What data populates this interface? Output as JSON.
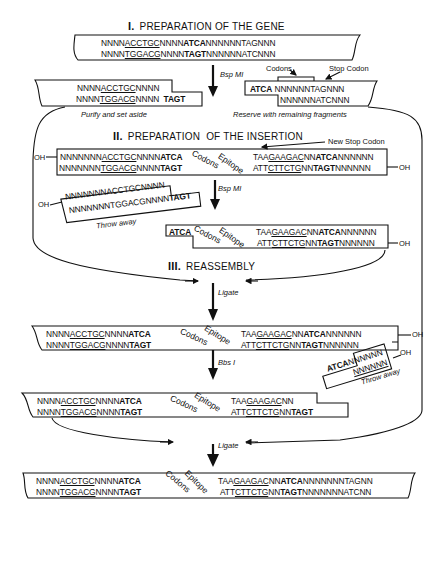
{
  "sections": {
    "s1": {
      "numeral": "I.",
      "title": "PREPARATION OF THE GENE"
    },
    "s2": {
      "numeral": "II.",
      "title": "PREPARATION  OF THE INSERTION"
    },
    "s3": {
      "numeral": "III.",
      "title": "REASSEMBLY"
    }
  },
  "steps": {
    "bspmi_1": "Bsp MI",
    "bspmi_2": "Bsp MI",
    "ligate_1": "Ligate",
    "bbsi": "Bbs I",
    "ligate_2": "Ligate"
  },
  "captions": {
    "purify": "Purify and set aside",
    "reserve": "Reserve with remaining fragments",
    "throw_away_1": "Throw away",
    "throw_away_2": "Throw away"
  },
  "annotations": {
    "codons": "Codons",
    "stop_codon": "Stop Codon",
    "new_stop_codon": "New Stop Codon",
    "oh": "OH"
  },
  "rotated_labels": {
    "codons": "Codons",
    "epitope": "Epitope"
  },
  "sequences": {
    "gene": {
      "top": [
        "NNNN",
        "ACCTGC",
        "NNNN",
        "ATCA",
        "NNNNNNTAGNNN"
      ],
      "bottom": [
        "NNNN",
        "TGGACG",
        "NNNN",
        "TAGT",
        "NNNNNNATCNNN"
      ]
    },
    "left_frag": {
      "top": [
        "NNNN",
        "ACCTGC",
        "NNNN"
      ],
      "bottom": [
        "NNNN",
        "TGGACG",
        "NNNN ",
        "TAGT"
      ]
    },
    "right_frag": {
      "top": [
        "ATCA",
        " NNNNNNTAGNNN"
      ],
      "bottom": [
        "NNNNNNATCNNN"
      ]
    },
    "insertion": {
      "top_left": [
        "NNNNNNN",
        "ACCTGC",
        "NNNN",
        "ATCA"
      ],
      "bottom_left": [
        "NNNNNNN",
        "TGGACG",
        "NNNN",
        "TAGT"
      ],
      "top_right": [
        "TAA",
        "GAAGAC",
        "NN",
        "ATCA",
        "NNNNNN"
      ],
      "bottom_right": [
        "ATT",
        "CTTCTG",
        "NN",
        "TAGT",
        "NNNNNN"
      ]
    },
    "throw_frag": {
      "top": "NNNNNNNACCTGCNNNN",
      "bottom": [
        "NNNNNNNTGGACGNNNN",
        "TAGT"
      ]
    },
    "insert_frag": {
      "top_left": "ATCA",
      "top_right": [
        "TAA",
        "GAAGAC",
        "NN",
        "ATCA",
        "NNNNNN"
      ],
      "bottom_right": [
        "ATT",
        "CTTCTG",
        "NN",
        "TAGT",
        "NNNNNN"
      ]
    },
    "ligated": {
      "top_left": [
        "NNNN",
        "ACCTGC",
        "NNNN",
        "ATCA"
      ],
      "bottom_left": [
        "NNNN",
        "TGGACG",
        "NNNN",
        "TAGT"
      ],
      "top_right": [
        "TAA",
        "GAAGAC",
        "NN",
        "ATCA",
        "NNNNNN"
      ],
      "bottom_right": [
        "ATT",
        "CTTCTG",
        "NN",
        "TAGT",
        "NNNNNN"
      ]
    },
    "small_throw": {
      "top": [
        "ATCA",
        "NNNNNN"
      ],
      "bottom": "NNNNNN"
    },
    "bbs_cut": {
      "top_left": [
        "NNNN",
        "ACCTGC",
        "NNNN",
        "ATCA"
      ],
      "bottom_left": [
        "NNNN",
        "TGGACG",
        "NNNN",
        "TAGT"
      ],
      "top_right": [
        "TAA",
        "GAAGAC",
        "NN"
      ],
      "bottom_right": [
        "ATT",
        "CTTCTG",
        "NN",
        "TAGT"
      ]
    },
    "final": {
      "top_left": [
        "NNNN",
        "ACCTGC",
        "NNNN",
        "ATCA"
      ],
      "bottom_left": [
        "NNNN",
        "TGGACG",
        "NNNN",
        "TAGT"
      ],
      "top_right": [
        "TAA",
        "GAAGAC",
        "NN",
        "ATCA",
        "NNNNNNNTAGNN"
      ],
      "bottom_right": [
        "ATT",
        "CTTCTG",
        "NN",
        "TAGT",
        "NNNNNNNATCNN"
      ]
    }
  }
}
